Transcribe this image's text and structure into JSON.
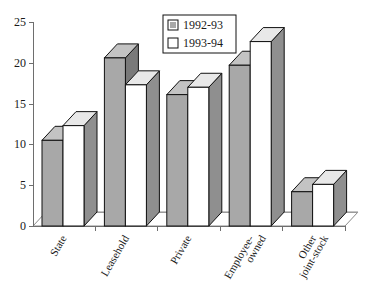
{
  "chart_data": {
    "type": "bar",
    "title": "",
    "subtitle": "",
    "xlabel": "",
    "ylabel": "",
    "ylim": [
      0,
      25
    ],
    "yticks": [
      "0",
      "5",
      "10",
      "15",
      "20",
      "25"
    ],
    "ytick_values": [
      0,
      5,
      10,
      15,
      20,
      25
    ],
    "grid": false,
    "legend_position": "top-center",
    "style": "3d-bar",
    "categories": [
      "State",
      "Leasehold",
      "Private",
      "Employee-\nowned",
      "Other\njoint-stock"
    ],
    "category_lines": [
      [
        "State"
      ],
      [
        "Leasehold"
      ],
      [
        "Private"
      ],
      [
        "Employee-",
        "owned"
      ],
      [
        "Other",
        "joint-stock"
      ]
    ],
    "series": [
      {
        "name": "1992-93",
        "color": "#a8a8a8",
        "values": [
          10.5,
          20.6,
          16.1,
          19.7,
          4.2
        ]
      },
      {
        "name": "1993-94",
        "color": "#ffffff",
        "values": [
          12.3,
          17.3,
          17.0,
          22.6,
          5.1
        ]
      }
    ]
  },
  "legend": {
    "entries": [
      {
        "label": "1992-93",
        "swatch": "#a8a8a8"
      },
      {
        "label": "1993-94",
        "swatch": "#ffffff"
      }
    ]
  },
  "colors": {
    "series_1_face": "#a8a8a8",
    "series_1_side": "#797979",
    "series_1_top": "#c3c3c3",
    "series_2_face": "#ffffff",
    "series_2_side": "#8f8f8f",
    "series_2_top": "#e8e8e8",
    "axis": "#6e6e6e",
    "outline": "#111111",
    "background": "#ffffff"
  }
}
